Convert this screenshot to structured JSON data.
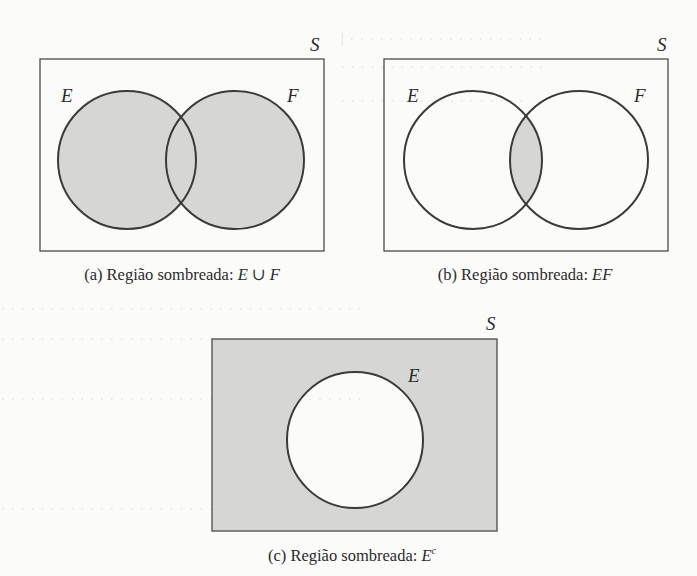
{
  "figure": {
    "colors": {
      "shade": "#d6d6d4",
      "stroke": "#3a3a3a",
      "background": "#fbfbfa"
    },
    "panels": [
      {
        "id": "a",
        "universe_label": "S",
        "set_labels": [
          "E",
          "F"
        ],
        "shaded_region": "E ∪ F",
        "caption_prefix": "(a) Região sombreada: ",
        "caption_math": "E ∪ F",
        "caption_sup": ""
      },
      {
        "id": "b",
        "universe_label": "S",
        "set_labels": [
          "E",
          "F"
        ],
        "shaded_region": "EF",
        "caption_prefix": "(b) Região sombreada: ",
        "caption_math": "EF",
        "caption_sup": ""
      },
      {
        "id": "c",
        "universe_label": "S",
        "set_labels": [
          "E"
        ],
        "shaded_region": "E^c",
        "caption_prefix": "(c) Região sombreada: ",
        "caption_math": "E",
        "caption_sup": "c"
      }
    ]
  }
}
